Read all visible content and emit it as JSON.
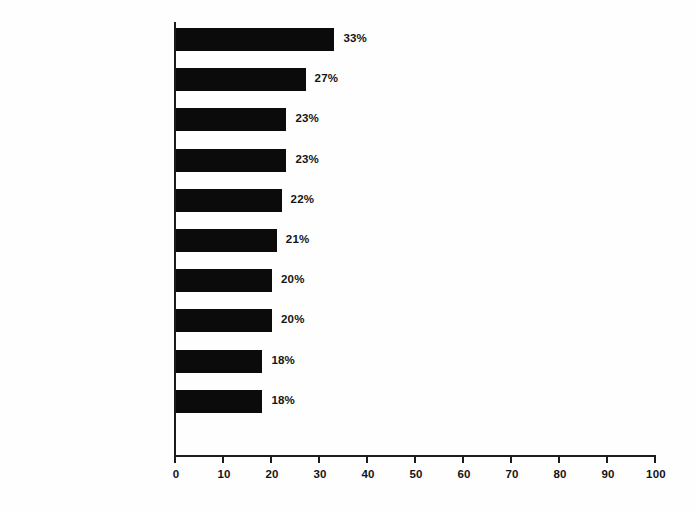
{
  "chart_data": {
    "type": "bar",
    "orientation": "horizontal",
    "title": "",
    "subtitle": "",
    "xlabel": "",
    "ylabel": "",
    "xlim": [
      0,
      100
    ],
    "xticks": [
      0,
      10,
      20,
      30,
      40,
      50,
      60,
      70,
      80,
      90,
      100
    ],
    "xtick_labels": [
      "0",
      "10",
      "20",
      "30",
      "40",
      "50",
      "60",
      "70",
      "80",
      "90",
      "100"
    ],
    "grid": false,
    "legend": false,
    "bar_color": "#0b0b0b",
    "axis_color": "#1c1c1c",
    "background_color": "#ffffff",
    "categories": [
      "Violence",
      "Problem alcohol use",
      "Antisocial\nbehavior",
      "Depression\nand/or suicide",
      "Driving and\nalcohol",
      "Gambling",
      "Tobacco",
      "School problems",
      "Illicit drugs",
      "Sexual\nintercourse"
    ],
    "values": [
      33,
      27,
      23,
      23,
      22,
      21,
      20,
      20,
      18,
      18
    ],
    "value_labels": [
      "33%",
      "27%",
      "23%",
      "23%",
      "22%",
      "21%",
      "20%",
      "20%",
      "18%",
      "18%"
    ],
    "bars": [
      {
        "category": "Violence",
        "value": 33,
        "label": "33%"
      },
      {
        "category": "Problem alcohol use",
        "value": 27,
        "label": "27%"
      },
      {
        "category": "Antisocial behavior",
        "value": 23,
        "label": "23%"
      },
      {
        "category": "Depression and/or suicide",
        "value": 23,
        "label": "23%"
      },
      {
        "category": "Driving and alcohol",
        "value": 22,
        "label": "22%"
      },
      {
        "category": "Gambling",
        "value": 21,
        "label": "21%"
      },
      {
        "category": "Tobacco",
        "value": 20,
        "label": "20%"
      },
      {
        "category": "School problems",
        "value": 20,
        "label": "20%"
      },
      {
        "category": "Illicit drugs",
        "value": 18,
        "label": "18%"
      },
      {
        "category": "Sexual intercourse",
        "value": 18,
        "label": "18%"
      }
    ]
  }
}
